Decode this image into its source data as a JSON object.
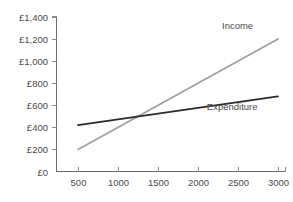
{
  "chart_data": {
    "type": "line",
    "title": "",
    "subtitle": "",
    "xlabel": "",
    "ylabel": "",
    "xlim": [
      0,
      3250
    ],
    "ylim": [
      0,
      1400
    ],
    "grid": false,
    "legend_position": "inline-annotation",
    "x_ticks": [
      500,
      1000,
      1500,
      2000,
      2500,
      3000
    ],
    "x_tick_labels": [
      "500",
      "1000",
      "1500",
      "2000",
      "2500",
      "3000"
    ],
    "y_ticks": [
      0,
      200,
      400,
      600,
      800,
      1000,
      1200,
      1400
    ],
    "y_tick_labels": [
      "£0",
      "£200",
      "£400",
      "£600",
      "£800",
      "£1,000",
      "£1,200",
      "£1,400"
    ],
    "x": [
      500,
      3000
    ],
    "series": [
      {
        "name": "Income",
        "label": "Income",
        "color": "#a0a0a0",
        "width": 1.8,
        "values": [
          200,
          1200
        ],
        "label_x": 2300,
        "label_y": 1290
      },
      {
        "name": "Expenditure",
        "label": "Expenditure",
        "color": "#2b2b2b",
        "width": 1.8,
        "values": [
          420,
          680
        ],
        "label_x": 2110,
        "label_y": 560
      }
    ],
    "annotations": [],
    "intersection": {
      "x": 1250,
      "y": 490
    }
  },
  "axes": {
    "axis_color": "#6b6b6b",
    "tick_color": "#8a8a8a",
    "label_color": "#4a4a4a"
  }
}
